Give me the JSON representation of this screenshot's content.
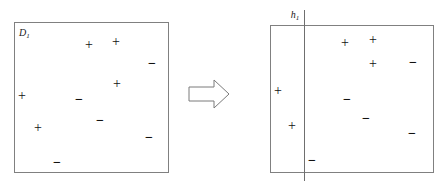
{
  "figure": {
    "type": "concept-diagram",
    "background_color": "#ffffff",
    "stroke_color": "#808080",
    "symbol_color": "#111111"
  },
  "left_panel": {
    "name": "dataset-panel",
    "label": "D",
    "label_sub": "1",
    "box": {
      "x": 14,
      "y": 22,
      "width": 155,
      "height": 151
    },
    "label_pos": {
      "x": 19,
      "y": 28
    },
    "points": [
      {
        "id": "p1",
        "sign": "+",
        "x": 89,
        "y": 45
      },
      {
        "id": "p2",
        "sign": "+",
        "x": 116,
        "y": 42
      },
      {
        "id": "p3",
        "sign": "−",
        "x": 152,
        "y": 64
      },
      {
        "id": "p4",
        "sign": "+",
        "x": 117,
        "y": 84
      },
      {
        "id": "p5",
        "sign": "+",
        "x": 22,
        "y": 96
      },
      {
        "id": "p6",
        "sign": "−",
        "x": 79,
        "y": 100
      },
      {
        "id": "p7",
        "sign": "−",
        "x": 100,
        "y": 121
      },
      {
        "id": "p8",
        "sign": "+",
        "x": 38,
        "y": 128
      },
      {
        "id": "p9",
        "sign": "−",
        "x": 149,
        "y": 138
      },
      {
        "id": "p10",
        "sign": "−",
        "x": 57,
        "y": 163
      }
    ]
  },
  "arrow": {
    "name": "transformation-arrow",
    "direction": "right",
    "box": {
      "x": 188,
      "y": 79,
      "width": 42,
      "height": 30
    }
  },
  "right_panel": {
    "name": "hypothesis-panel",
    "label": "h",
    "label_sub": "1",
    "box": {
      "x": 270,
      "y": 25,
      "width": 164,
      "height": 148
    },
    "divider": {
      "x": 304,
      "y_top": 10,
      "y_bottom": 181
    },
    "divider_label_pos": {
      "x": 295,
      "y": 10
    },
    "points": [
      {
        "id": "q1",
        "sign": "+",
        "x": 345,
        "y": 43
      },
      {
        "id": "q2",
        "sign": "+",
        "x": 373,
        "y": 40
      },
      {
        "id": "q3",
        "sign": "+",
        "x": 373,
        "y": 64
      },
      {
        "id": "q4",
        "sign": "−",
        "x": 413,
        "y": 63
      },
      {
        "id": "q5",
        "sign": "+",
        "x": 278,
        "y": 91
      },
      {
        "id": "q6",
        "sign": "−",
        "x": 347,
        "y": 100
      },
      {
        "id": "q7",
        "sign": "−",
        "x": 366,
        "y": 119
      },
      {
        "id": "q8",
        "sign": "+",
        "x": 292,
        "y": 126
      },
      {
        "id": "q9",
        "sign": "−",
        "x": 412,
        "y": 134
      },
      {
        "id": "q10",
        "sign": "−",
        "x": 312,
        "y": 161
      }
    ]
  }
}
